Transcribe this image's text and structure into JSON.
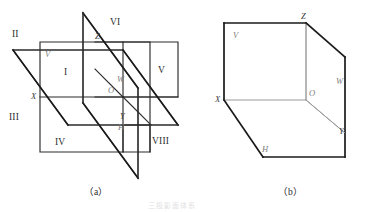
{
  "figure": {
    "background_color": "#ffffff",
    "line_color": "#2b2b2b",
    "light_line_color": "#9a9a9a",
    "width": 369,
    "height": 212
  },
  "panel_a": {
    "caption": "（a）",
    "octant_labels": [
      {
        "key": "I",
        "text": "I"
      },
      {
        "key": "II",
        "text": "II"
      },
      {
        "key": "III",
        "text": "III"
      },
      {
        "key": "IV",
        "text": "IV"
      },
      {
        "key": "V",
        "text": "V"
      },
      {
        "key": "VI",
        "text": "VI"
      },
      {
        "key": "VII",
        "text": "VII"
      },
      {
        "key": "VIII",
        "text": "VIII"
      }
    ],
    "plane_labels": [
      {
        "key": "V",
        "text": "V"
      },
      {
        "key": "W",
        "text": "W"
      },
      {
        "key": "H",
        "text": "H"
      }
    ],
    "axis_labels": [
      {
        "key": "X",
        "text": "X"
      },
      {
        "key": "Y",
        "text": "Y"
      },
      {
        "key": "Z",
        "text": "Z"
      },
      {
        "key": "O",
        "text": "O"
      }
    ]
  },
  "panel_b": {
    "caption": "（b）",
    "plane_labels": [
      {
        "key": "V",
        "text": "V"
      },
      {
        "key": "W",
        "text": "W"
      },
      {
        "key": "H",
        "text": "H"
      }
    ],
    "axis_labels": [
      {
        "key": "X",
        "text": "X"
      },
      {
        "key": "Y",
        "text": "Y"
      },
      {
        "key": "Z",
        "text": "Z"
      },
      {
        "key": "O",
        "text": "O"
      }
    ]
  },
  "footnote": {
    "text": "三投影面体系"
  }
}
